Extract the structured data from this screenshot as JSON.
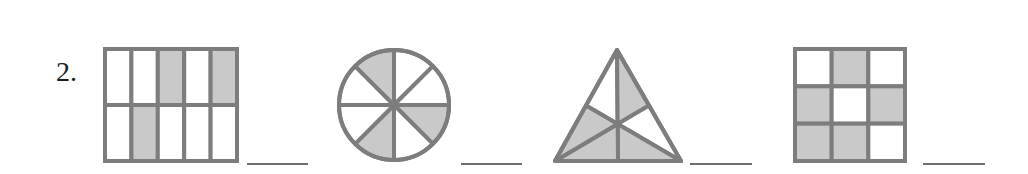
{
  "problem": {
    "number_label": "2.",
    "colors": {
      "line": "#7d7d7d",
      "shade": "#c9c9c9",
      "fill": "#ffffff",
      "answer_line": "#6e6e6e"
    },
    "figures": [
      {
        "id": "rect-grid",
        "shape": "rectangle grid",
        "columns": 5,
        "rows": 2,
        "shaded_cells": [
          [
            0,
            2
          ],
          [
            0,
            4
          ],
          [
            1,
            1
          ]
        ],
        "shaded_count": 3,
        "total_parts": 10,
        "answer": ""
      },
      {
        "id": "circle",
        "shape": "circle",
        "sectors": 8,
        "shaded_sectors": [
          "east-southeast",
          "south-southwest",
          "northwest-north"
        ],
        "shaded_count": 3,
        "total_parts": 8,
        "answer": ""
      },
      {
        "id": "triangle",
        "shape": "triangle divided by medians",
        "regions": 6,
        "shaded_regions": [
          "top-right",
          "bottom-right",
          "bottom-left",
          "left-lower"
        ],
        "shaded_count": 4,
        "total_parts": 6,
        "answer": ""
      },
      {
        "id": "square-grid",
        "shape": "square grid",
        "columns": 3,
        "rows": 3,
        "shaded_cells": [
          [
            0,
            1
          ],
          [
            1,
            0
          ],
          [
            1,
            2
          ],
          [
            2,
            0
          ],
          [
            2,
            1
          ]
        ],
        "shaded_count": 5,
        "total_parts": 9,
        "answer": ""
      }
    ]
  }
}
